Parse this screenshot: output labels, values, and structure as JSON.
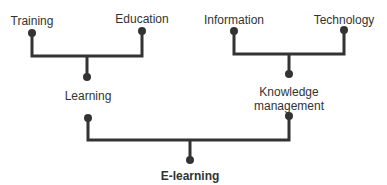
{
  "diagram": {
    "nodes": {
      "training": "Training",
      "education": "Education",
      "information": "Information",
      "technology": "Technology",
      "learning": "Learning",
      "km_line1": "Knowledge",
      "km_line2": "management",
      "elearning": "E-learning"
    },
    "edges": [
      {
        "from": "Training",
        "to": "Learning"
      },
      {
        "from": "Education",
        "to": "Learning"
      },
      {
        "from": "Information",
        "to": "Knowledge management"
      },
      {
        "from": "Technology",
        "to": "Knowledge management"
      },
      {
        "from": "Learning",
        "to": "E-learning"
      },
      {
        "from": "Knowledge management",
        "to": "E-learning"
      }
    ],
    "colors": {
      "line": "#333333",
      "text": "#333333"
    }
  }
}
